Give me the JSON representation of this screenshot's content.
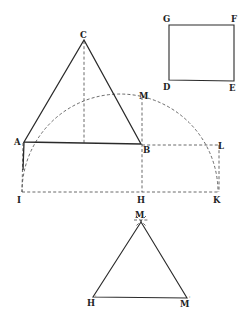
{
  "figure": {
    "kind": "geometric construction",
    "labels": {
      "C": "C",
      "A": "A",
      "B": "B",
      "M": "M",
      "L": "L",
      "I": "I",
      "H": "H",
      "K": "K",
      "G": "G",
      "F": "F",
      "D": "D",
      "E": "E",
      "M_bottom": "M",
      "H_prime": "H",
      "M_prime": "M",
      "prime_mark": "'"
    },
    "colors": {
      "ink": "#2a2a2a",
      "background": "#ffffff"
    }
  }
}
